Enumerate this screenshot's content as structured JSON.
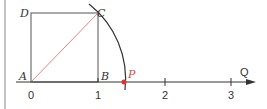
{
  "diagram": {
    "points": {
      "A": "A",
      "B": "B",
      "C": "C",
      "D": "D",
      "P": "P"
    },
    "ticks": [
      "0",
      "1",
      "2",
      "3"
    ],
    "axis_label": "Q",
    "colors": {
      "line": "#333333",
      "diagonal": "#e8837a",
      "point": "#e03030",
      "p_label": "#d05050"
    }
  }
}
